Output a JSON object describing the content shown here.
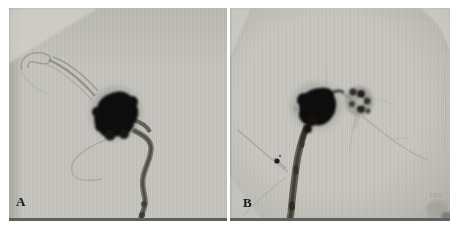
{
  "figure": {
    "colors": {
      "film_gray": "#c2c1bb",
      "contrast_black": "#0b0a08",
      "margin_white": "#ffffff",
      "frame_line": "#61605b"
    },
    "panels": [
      {
        "label": "A"
      },
      {
        "label": "B",
        "corner_mark": "FEM"
      }
    ]
  }
}
